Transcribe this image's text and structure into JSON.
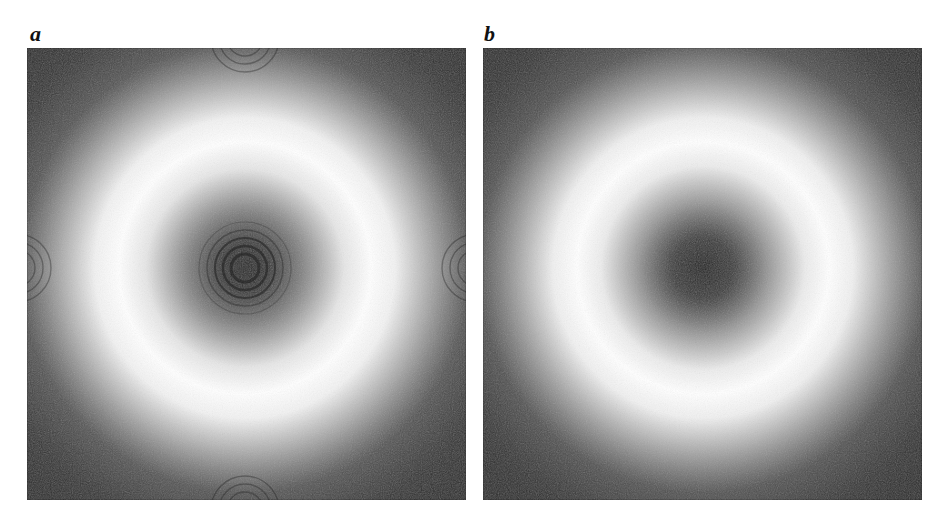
{
  "figure": {
    "panels": [
      {
        "label": "a",
        "description": "Ring-shaped intensity pattern with concentric interference fringes at center and edges",
        "has_fringes": true
      },
      {
        "label": "b",
        "description": "Smooth ring-shaped intensity pattern without fringes",
        "has_fringes": false
      }
    ],
    "colors": {
      "background": "#ffffff",
      "dark": "#2b2b2b",
      "center_dark": "#1f1f1f",
      "ring_bright": "#ffffff"
    }
  }
}
